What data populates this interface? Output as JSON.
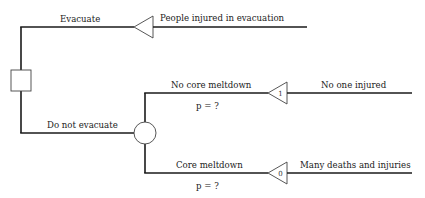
{
  "diagram": {
    "type": "decision-tree",
    "decision_node": {
      "shape": "square"
    },
    "branches": {
      "evacuate": {
        "label": "Evacuate",
        "outcome": "People injured in evacuation"
      },
      "do_not_evacuate": {
        "label": "Do not evacuate",
        "chance_node": {
          "shape": "circle"
        },
        "sub_branches": [
          {
            "label": "No core meltdown",
            "probability": "p = ?",
            "value": "1",
            "outcome": "No one injured"
          },
          {
            "label": "Core meltdown",
            "probability": "p = ?",
            "value": "0",
            "outcome": "Many deaths and injuries"
          }
        ]
      }
    }
  }
}
